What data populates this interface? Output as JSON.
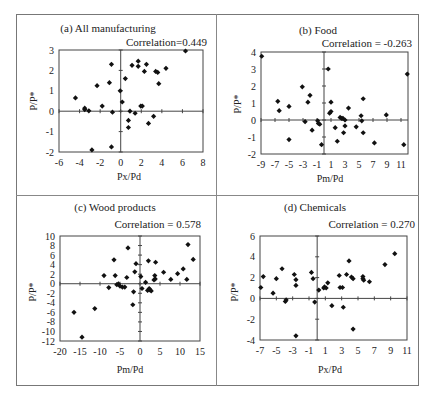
{
  "figure": {
    "panels": [
      {
        "id": "a",
        "title": "(a) All manufacturing",
        "correlation": "Correlation=0.449",
        "xlabel": "Px/Pd",
        "ylabel": "P/P*"
      },
      {
        "id": "b",
        "title": "(b) Food",
        "correlation": "Correlation = -0.263",
        "xlabel": "Pm/Pd",
        "ylabel": "P/P*"
      },
      {
        "id": "c",
        "title": "(c) Wood products",
        "correlation": "Correlation = 0.578",
        "xlabel": "Pm/Pd",
        "ylabel": "P/P*"
      },
      {
        "id": "d",
        "title": "(d) Chemicals",
        "correlation": "Correlation = 0.270",
        "xlabel": "Px/Pd",
        "ylabel": "P/P*"
      }
    ]
  },
  "chart_data": [
    {
      "type": "scatter",
      "title": "(a) All manufacturing",
      "annotation": "Correlation=0.449",
      "xlabel": "Px/Pd",
      "ylabel": "P/P*",
      "xlim": [
        -6,
        8
      ],
      "ylim": [
        -2,
        3
      ],
      "xticks": [
        -6,
        -4,
        -2,
        0,
        2,
        4,
        6,
        8
      ],
      "yticks": [
        -2,
        -1,
        0,
        1,
        2,
        3
      ],
      "grid": false,
      "points": [
        [
          -4.4,
          0.65
        ],
        [
          -3.5,
          0.15
        ],
        [
          -3.5,
          0.08
        ],
        [
          -3.1,
          0.02
        ],
        [
          -2.8,
          -1.9
        ],
        [
          -2.3,
          1.25
        ],
        [
          -1.8,
          0.25
        ],
        [
          -1.1,
          1.4
        ],
        [
          -0.9,
          2.3
        ],
        [
          -0.8,
          -0.05
        ],
        [
          -0.9,
          -1.75
        ],
        [
          -0.05,
          1.0
        ],
        [
          0.15,
          0.45
        ],
        [
          0.45,
          1.6
        ],
        [
          0.75,
          -0.45
        ],
        [
          0.75,
          -0.8
        ],
        [
          0.9,
          0.0
        ],
        [
          1.1,
          2.25
        ],
        [
          1.4,
          -0.1
        ],
        [
          1.7,
          2.45
        ],
        [
          1.7,
          2.2
        ],
        [
          1.95,
          0.25
        ],
        [
          2.1,
          0.25
        ],
        [
          2.3,
          1.95
        ],
        [
          2.5,
          2.3
        ],
        [
          2.7,
          -0.6
        ],
        [
          3.2,
          -0.25
        ],
        [
          3.4,
          1.95
        ],
        [
          3.6,
          1.9
        ],
        [
          3.7,
          1.35
        ],
        [
          4.4,
          2.1
        ],
        [
          6.3,
          2.95
        ]
      ]
    },
    {
      "type": "scatter",
      "title": "(b) Food",
      "annotation": "Correlation = -0.263",
      "xlabel": "Pm/Pd",
      "ylabel": "P/P*",
      "xlim": [
        -9,
        12
      ],
      "ylim": [
        -2,
        4
      ],
      "xticks": [
        -9,
        -7,
        -5,
        -3,
        -1,
        1,
        3,
        5,
        7,
        9,
        11
      ],
      "yticks": [
        -2,
        -1,
        0,
        1,
        2,
        3,
        4
      ],
      "grid": false,
      "points": [
        [
          -8.9,
          3.75
        ],
        [
          -6.6,
          1.1
        ],
        [
          -6.4,
          0.55
        ],
        [
          -5.0,
          0.8
        ],
        [
          -5.0,
          -1.15
        ],
        [
          -3.1,
          1.95
        ],
        [
          -2.7,
          -0.1
        ],
        [
          -2.3,
          1.05
        ],
        [
          -2.0,
          1.45
        ],
        [
          -1.7,
          -0.6
        ],
        [
          -0.9,
          -0.05
        ],
        [
          -0.8,
          -0.2
        ],
        [
          -0.6,
          -0.25
        ],
        [
          -0.35,
          -1.45
        ],
        [
          0.6,
          3.0
        ],
        [
          0.8,
          0.4
        ],
        [
          1.0,
          1.05
        ],
        [
          1.0,
          0.5
        ],
        [
          1.6,
          -0.45
        ],
        [
          1.9,
          -1.25
        ],
        [
          2.3,
          0.15
        ],
        [
          2.5,
          0.1
        ],
        [
          2.7,
          0.1
        ],
        [
          2.8,
          -0.75
        ],
        [
          3.0,
          0.0
        ],
        [
          3.0,
          -0.35
        ],
        [
          3.5,
          0.7
        ],
        [
          4.6,
          -0.4
        ],
        [
          5.3,
          0.25
        ],
        [
          5.4,
          -0.05
        ],
        [
          5.6,
          1.25
        ],
        [
          5.6,
          -0.75
        ],
        [
          7.2,
          -1.35
        ],
        [
          8.9,
          0.3
        ],
        [
          11.4,
          -1.45
        ],
        [
          11.9,
          2.7
        ]
      ]
    },
    {
      "type": "scatter",
      "title": "(c) Wood products",
      "annotation": "Correlation = 0.578",
      "xlabel": "Pm/Pd",
      "ylabel": "P/P*",
      "xlim": [
        -20,
        15
      ],
      "ylim": [
        -12,
        10
      ],
      "xticks": [
        -20,
        -15,
        -10,
        -5,
        0,
        5,
        10,
        15
      ],
      "yticks": [
        -12,
        -10,
        -8,
        -6,
        -4,
        -2,
        0,
        2,
        4,
        6,
        8,
        10
      ],
      "grid": false,
      "points": [
        [
          -16.5,
          -6.0
        ],
        [
          -14.5,
          -11.2
        ],
        [
          -11.3,
          -5.2
        ],
        [
          -9.0,
          1.7
        ],
        [
          -7.8,
          -0.8
        ],
        [
          -6.5,
          5.0
        ],
        [
          -6.2,
          1.7
        ],
        [
          -5.8,
          -0.2
        ],
        [
          -5.4,
          0.0
        ],
        [
          -5.0,
          -0.5
        ],
        [
          -4.4,
          -0.7
        ],
        [
          -3.8,
          -0.7
        ],
        [
          -3.3,
          1.3
        ],
        [
          -3.0,
          7.5
        ],
        [
          -1.8,
          -4.4
        ],
        [
          -1.6,
          -1.7
        ],
        [
          -1.3,
          2.5
        ],
        [
          -1.0,
          4.2
        ],
        [
          0.2,
          1.5
        ],
        [
          0.5,
          -1.0
        ],
        [
          1.4,
          0.3
        ],
        [
          1.9,
          -1.4
        ],
        [
          2.1,
          4.8
        ],
        [
          2.3,
          -1.0
        ],
        [
          2.5,
          -1.3
        ],
        [
          2.8,
          -1.5
        ],
        [
          3.5,
          0.8
        ],
        [
          3.7,
          1.7
        ],
        [
          3.8,
          1.0
        ],
        [
          3.9,
          4.5
        ],
        [
          5.9,
          2.4
        ],
        [
          7.7,
          0.9
        ],
        [
          9.4,
          2.1
        ],
        [
          10.8,
          3.1
        ],
        [
          11.7,
          0.9
        ],
        [
          12.0,
          8.2
        ],
        [
          13.3,
          5.1
        ]
      ]
    },
    {
      "type": "scatter",
      "title": "(d) Chemicals",
      "annotation": "Correlation = 0.270",
      "xlabel": "Px/Pd",
      "ylabel": "P/P*",
      "xlim": [
        -7,
        11
      ],
      "ylim": [
        -4,
        6
      ],
      "xticks": [
        -7,
        -5,
        -3,
        -1,
        1,
        3,
        5,
        7,
        9,
        11
      ],
      "yticks": [
        -4,
        -2,
        0,
        2,
        4,
        6
      ],
      "grid": false,
      "points": [
        [
          -6.9,
          1.05
        ],
        [
          -6.6,
          2.1
        ],
        [
          -5.4,
          0.5
        ],
        [
          -5.0,
          1.9
        ],
        [
          -4.3,
          2.85
        ],
        [
          -3.9,
          -0.3
        ],
        [
          -3.8,
          -0.15
        ],
        [
          -2.8,
          2.3
        ],
        [
          -2.6,
          1.8
        ],
        [
          -2.6,
          1.25
        ],
        [
          -2.6,
          -3.6
        ],
        [
          -0.7,
          2.5
        ],
        [
          -0.5,
          1.9
        ],
        [
          -0.3,
          -0.35
        ],
        [
          0.2,
          0.8
        ],
        [
          0.8,
          1.0
        ],
        [
          0.9,
          1.1
        ],
        [
          1.1,
          1.0
        ],
        [
          1.3,
          1.5
        ],
        [
          1.8,
          -0.7
        ],
        [
          2.7,
          2.2
        ],
        [
          2.8,
          1.05
        ],
        [
          3.1,
          1.05
        ],
        [
          3.2,
          -0.85
        ],
        [
          3.6,
          2.3
        ],
        [
          3.9,
          3.6
        ],
        [
          4.2,
          2.05
        ],
        [
          4.4,
          1.9
        ],
        [
          4.4,
          -2.95
        ],
        [
          5.6,
          2.1
        ],
        [
          5.7,
          1.75
        ],
        [
          5.6,
          1.9
        ],
        [
          6.4,
          1.6
        ],
        [
          8.3,
          3.25
        ],
        [
          9.5,
          4.3
        ]
      ]
    }
  ]
}
